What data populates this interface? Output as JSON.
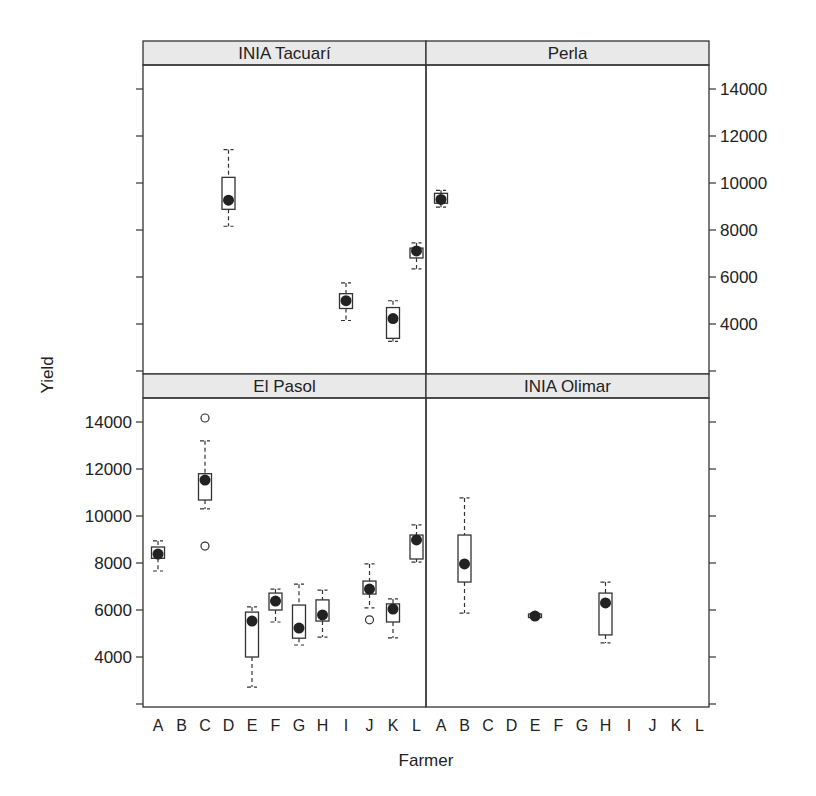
{
  "chart_data": {
    "type": "boxplot",
    "title": "",
    "xlabel": "Farmer",
    "ylabel": "Yield",
    "ylim": [
      1800,
      15300
    ],
    "y_ticks": [
      4000,
      6000,
      8000,
      10000,
      12000,
      14000
    ],
    "y_tick_labels": [
      "4000",
      "6000",
      "8000",
      "10000",
      "12000",
      "14000"
    ],
    "categories": [
      "A",
      "B",
      "C",
      "D",
      "E",
      "F",
      "G",
      "H",
      "I",
      "J",
      "K",
      "L"
    ],
    "grid": false,
    "layout": "2x2 lattice panels; left y-axis labels on bottom row, right y-axis labels on top row",
    "panels": [
      {
        "name": "INIA Tacuarí",
        "row": 0,
        "col": 0,
        "boxes": [
          {
            "farmer": "D",
            "whisker_low": 8160,
            "q1": 8880,
            "median": 9270,
            "q3": 10240,
            "whisker_high": 11420,
            "outliers": []
          },
          {
            "farmer": "I",
            "whisker_low": 4150,
            "q1": 4660,
            "median": 4990,
            "q3": 5290,
            "whisker_high": 5750,
            "outliers": []
          },
          {
            "farmer": "K",
            "whisker_low": 3260,
            "q1": 3390,
            "median": 4230,
            "q3": 4700,
            "whisker_high": 4990,
            "outliers": []
          },
          {
            "farmer": "L",
            "whisker_low": 6350,
            "q1": 6810,
            "median": 7110,
            "q3": 7230,
            "whisker_high": 7450,
            "outliers": []
          }
        ]
      },
      {
        "name": "Perla",
        "row": 0,
        "col": 1,
        "boxes": [
          {
            "farmer": "A",
            "whisker_low": 8970,
            "q1": 9140,
            "median": 9300,
            "q3": 9560,
            "whisker_high": 9690,
            "outliers": []
          }
        ]
      },
      {
        "name": "El Pasol",
        "row": 1,
        "col": 0,
        "boxes": [
          {
            "farmer": "A",
            "whisker_low": 7660,
            "q1": 8200,
            "median": 8380,
            "q3": 8680,
            "whisker_high": 8940,
            "outliers": []
          },
          {
            "farmer": "C",
            "whisker_low": 10300,
            "q1": 10680,
            "median": 11530,
            "q3": 11800,
            "whisker_high": 13200,
            "outliers": [
              14170,
              8720
            ]
          },
          {
            "farmer": "E",
            "whisker_low": 2720,
            "q1": 4000,
            "median": 5530,
            "q3": 5910,
            "whisker_high": 6130,
            "outliers": []
          },
          {
            "farmer": "F",
            "whisker_low": 5490,
            "q1": 6000,
            "median": 6380,
            "q3": 6720,
            "whisker_high": 6890,
            "outliers": []
          },
          {
            "farmer": "G",
            "whisker_low": 4510,
            "q1": 4800,
            "median": 5230,
            "q3": 6210,
            "whisker_high": 7100,
            "outliers": []
          },
          {
            "farmer": "H",
            "whisker_low": 4850,
            "q1": 5530,
            "median": 5790,
            "q3": 6430,
            "whisker_high": 6850,
            "outliers": []
          },
          {
            "farmer": "J",
            "whisker_low": 6090,
            "q1": 6680,
            "median": 6890,
            "q3": 7230,
            "whisker_high": 7960,
            "outliers": [
              5580
            ]
          },
          {
            "farmer": "K",
            "whisker_low": 4810,
            "q1": 5490,
            "median": 6040,
            "q3": 6260,
            "whisker_high": 6470,
            "outliers": []
          },
          {
            "farmer": "L",
            "whisker_low": 8040,
            "q1": 8170,
            "median": 8980,
            "q3": 9190,
            "whisker_high": 9620,
            "outliers": []
          }
        ]
      },
      {
        "name": "INIA Olimar",
        "row": 1,
        "col": 1,
        "boxes": [
          {
            "farmer": "B",
            "whisker_low": 5870,
            "q1": 7190,
            "median": 7960,
            "q3": 9190,
            "whisker_high": 10770,
            "outliers": []
          },
          {
            "farmer": "E",
            "whisker_low": 5660,
            "q1": 5680,
            "median": 5740,
            "q3": 5830,
            "whisker_high": 5850,
            "outliers": []
          },
          {
            "farmer": "H",
            "whisker_low": 4600,
            "q1": 4940,
            "median": 6300,
            "q3": 6720,
            "whisker_high": 7190,
            "outliers": []
          }
        ]
      }
    ]
  },
  "colors": {
    "strip_bg": "#e9e9e9",
    "frame": "#333333",
    "text": "#222222",
    "box_fill": "#ffffff",
    "median_dot": "#222222"
  }
}
